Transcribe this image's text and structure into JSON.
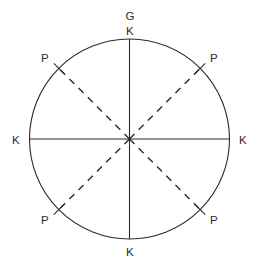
{
  "figure": {
    "type": "geometric-diagram",
    "background_color": "#ffffff",
    "stroke_color": "#2b2b2b",
    "label_color": "#2b2b2b"
  },
  "geometry": {
    "circle": {
      "center_x": 129.5,
      "center_y": 139,
      "radius": 100,
      "stroke_width": 1.1
    },
    "solid_lines": [
      {
        "name": "vertical-diameter",
        "x1": 129.5,
        "y1": 39,
        "x2": 129.5,
        "y2": 239
      },
      {
        "name": "horizontal-diameter",
        "x1": 29.5,
        "y1": 139,
        "x2": 229.5,
        "y2": 139
      }
    ],
    "dashed_lines": [
      {
        "name": "diagonal-upper-left",
        "x1": 129.5,
        "y1": 139,
        "x2": 58.8,
        "y2": 68.3
      },
      {
        "name": "diagonal-upper-right",
        "x1": 129.5,
        "y1": 139,
        "x2": 200.2,
        "y2": 68.3
      },
      {
        "name": "diagonal-lower-left",
        "x1": 129.5,
        "y1": 139,
        "x2": 58.8,
        "y2": 209.7
      },
      {
        "name": "diagonal-lower-right",
        "x1": 129.5,
        "y1": 139,
        "x2": 200.2,
        "y2": 209.7
      }
    ],
    "dash_pattern": "7 6",
    "tick_marks": [
      {
        "name": "tick-upper-left",
        "x1": 53.8,
        "y1": 63.3,
        "x2": 63.8,
        "y2": 73.3
      },
      {
        "name": "tick-upper-right",
        "x1": 205.2,
        "y1": 63.3,
        "x2": 195.2,
        "y2": 73.3
      },
      {
        "name": "tick-lower-left",
        "x1": 53.8,
        "y1": 214.7,
        "x2": 63.8,
        "y2": 204.7
      },
      {
        "name": "tick-lower-right",
        "x1": 205.2,
        "y1": 214.7,
        "x2": 195.2,
        "y2": 204.7
      }
    ]
  },
  "labels": {
    "top_outer": {
      "text": "G",
      "x": 130,
      "y": 17
    },
    "top_inner": {
      "text": "K",
      "x": 130,
      "y": 32
    },
    "bottom": {
      "text": "K",
      "x": 130,
      "y": 253
    },
    "left": {
      "text": "K",
      "x": 16,
      "y": 141
    },
    "right": {
      "text": "K",
      "x": 243,
      "y": 141
    },
    "upper_left": {
      "text": "P",
      "x": 45,
      "y": 59
    },
    "upper_right": {
      "text": "P",
      "x": 214,
      "y": 59
    },
    "lower_left": {
      "text": "P",
      "x": 45,
      "y": 221
    },
    "lower_right": {
      "text": "P",
      "x": 214,
      "y": 221
    }
  }
}
